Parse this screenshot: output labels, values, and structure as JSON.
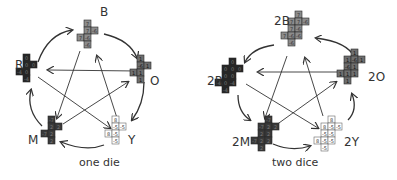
{
  "cell_size": 7,
  "colors": {
    "B": "#8c8c8c",
    "O": "#6e6e6e",
    "Y": "#ffffff",
    "M": "#3a3a3a",
    "R": "#262626",
    "text_light": "#d0d0d0",
    "text_dark": "#333333",
    "stroke": "#2a2a2a",
    "arrow": "#333333"
  },
  "panels": [
    {
      "caption": "one die",
      "caption_pos": [
        79,
        163
      ],
      "dice": [
        {
          "name": "B",
          "label": "B",
          "label_pos": [
            100,
            9
          ],
          "color": "B",
          "origin": [
            77,
            20
          ],
          "cells": [
            [
              1,
              0,
              "7"
            ],
            [
              1,
              1,
              "7"
            ],
            [
              2,
              1,
              "-6"
            ],
            [
              0,
              2,
              "7"
            ],
            [
              1,
              2,
              "-6"
            ],
            [
              1,
              3,
              "-6"
            ]
          ]
        },
        {
          "name": "O",
          "label": "O",
          "label_pos": [
            150,
            78
          ],
          "color": "O",
          "origin": [
            130,
            55
          ],
          "cells": [
            [
              1,
              0,
              "1"
            ],
            [
              1,
              1,
              "-6"
            ],
            [
              2,
              1,
              "1"
            ],
            [
              0,
              2,
              "1"
            ],
            [
              1,
              2,
              "1"
            ],
            [
              1,
              3,
              "1"
            ]
          ]
        },
        {
          "name": "Y",
          "label": "Y",
          "label_pos": [
            128,
            137
          ],
          "color": "Y",
          "origin": [
            105,
            116
          ],
          "cells": [
            [
              1,
              0,
              "8"
            ],
            [
              1,
              1,
              "-5"
            ],
            [
              2,
              1,
              "-5"
            ],
            [
              0,
              2,
              "8"
            ],
            [
              1,
              2,
              "-5"
            ],
            [
              1,
              3,
              "-5"
            ]
          ]
        },
        {
          "name": "M",
          "label": "M",
          "label_pos": [
            28,
            137
          ],
          "color": "M",
          "origin": [
            41,
            116
          ],
          "cells": [
            [
              1,
              0,
              "-7"
            ],
            [
              1,
              1,
              "2"
            ],
            [
              2,
              1,
              "2"
            ],
            [
              0,
              2,
              "-7"
            ],
            [
              1,
              2,
              "2"
            ],
            [
              1,
              3,
              "2"
            ]
          ]
        },
        {
          "name": "R",
          "label": "R",
          "label_pos": [
            15,
            62
          ],
          "color": "R",
          "origin": [
            16,
            54
          ],
          "cells": [
            [
              1,
              0,
              "0"
            ],
            [
              1,
              1,
              "0"
            ],
            [
              2,
              1,
              "0"
            ],
            [
              0,
              2,
              "-4"
            ],
            [
              1,
              2,
              "0"
            ],
            [
              1,
              3,
              "-4"
            ]
          ]
        }
      ],
      "arrows": [
        {
          "from": "R",
          "to": "B",
          "path": "M38 62 Q48 34 72 30",
          "type": "curve"
        },
        {
          "from": "B",
          "to": "O",
          "path": "M104 34 Q130 40 137 58",
          "type": "curve"
        },
        {
          "from": "O",
          "to": "Y",
          "path": "M144 82 Q144 104 132 120",
          "type": "curve"
        },
        {
          "from": "Y",
          "to": "M",
          "path": "M104 145 Q86 152 61 142",
          "type": "curve"
        },
        {
          "from": "M",
          "to": "R",
          "path": "M42 126 Q26 110 31 90",
          "type": "curve"
        },
        {
          "from": "O",
          "to": "R",
          "path": "M137 71 L48 70",
          "type": "straight"
        },
        {
          "from": "R",
          "to": "Y",
          "path": "M38 77 L110 128",
          "type": "straight"
        },
        {
          "from": "Y",
          "to": "B",
          "path": "M117 118 L97 56",
          "type": "straight"
        },
        {
          "from": "B",
          "to": "M",
          "path": "M80 51 L57 118",
          "type": "straight"
        },
        {
          "from": "M",
          "to": "O",
          "path": "M63 124 L128 82",
          "type": "straight"
        }
      ]
    },
    {
      "caption": "two dice",
      "caption_pos": [
        275,
        163
      ],
      "dice": [
        {
          "name": "2B",
          "label": "2B",
          "label_pos": [
            274,
            18
          ],
          "color": "B",
          "origin": [
            281,
            11
          ],
          "cells": [
            [
              2,
              0,
              "7"
            ],
            [
              1,
              1,
              "7"
            ],
            [
              2,
              1,
              "7"
            ],
            [
              3,
              1,
              "-6"
            ],
            [
              1,
              2,
              "7"
            ],
            [
              2,
              2,
              "-6"
            ],
            [
              0,
              3,
              "7"
            ],
            [
              1,
              3,
              "-6"
            ],
            [
              2,
              3,
              "-6"
            ],
            [
              1,
              4,
              "-6"
            ]
          ]
        },
        {
          "name": "2O",
          "label": "2O",
          "label_pos": [
            368,
            74
          ],
          "color": "O",
          "origin": [
            337,
            49
          ],
          "cells": [
            [
              2,
              0,
              "1"
            ],
            [
              1,
              1,
              "1"
            ],
            [
              2,
              1,
              "-6"
            ],
            [
              3,
              1,
              "1"
            ],
            [
              1,
              2,
              "-6"
            ],
            [
              2,
              2,
              "1"
            ],
            [
              0,
              3,
              "1"
            ],
            [
              1,
              3,
              "1"
            ],
            [
              2,
              3,
              "1"
            ],
            [
              1,
              4,
              "1"
            ]
          ]
        },
        {
          "name": "2Y",
          "label": "2Y",
          "label_pos": [
            344,
            139
          ],
          "color": "Y",
          "origin": [
            314,
            116
          ],
          "cells": [
            [
              2,
              0,
              "8"
            ],
            [
              1,
              1,
              "8"
            ],
            [
              2,
              1,
              "-5"
            ],
            [
              3,
              1,
              "-5"
            ],
            [
              1,
              2,
              "-5"
            ],
            [
              2,
              2,
              "-5"
            ],
            [
              0,
              3,
              "8"
            ],
            [
              1,
              3,
              "-5"
            ],
            [
              2,
              3,
              "-5"
            ],
            [
              1,
              4,
              "-5"
            ]
          ]
        },
        {
          "name": "2M",
          "label": "2M",
          "label_pos": [
            232,
            139
          ],
          "color": "M",
          "origin": [
            251,
            116
          ],
          "cells": [
            [
              2,
              0,
              "-7"
            ],
            [
              1,
              1,
              "-7"
            ],
            [
              2,
              1,
              "2"
            ],
            [
              3,
              1,
              "2"
            ],
            [
              1,
              2,
              "2"
            ],
            [
              2,
              2,
              "2"
            ],
            [
              0,
              3,
              "-7"
            ],
            [
              1,
              3,
              "2"
            ],
            [
              2,
              3,
              "2"
            ],
            [
              1,
              4,
              "2"
            ]
          ]
        },
        {
          "name": "2R",
          "label": "2R",
          "label_pos": [
            207,
            78
          ],
          "color": "R",
          "origin": [
            215,
            58
          ],
          "cells": [
            [
              2,
              0,
              "0"
            ],
            [
              1,
              1,
              "0"
            ],
            [
              2,
              1,
              "0"
            ],
            [
              3,
              1,
              "0"
            ],
            [
              1,
              2,
              "0"
            ],
            [
              2,
              2,
              "0"
            ],
            [
              0,
              3,
              "-4"
            ],
            [
              1,
              3,
              "0"
            ],
            [
              2,
              3,
              "-4"
            ],
            [
              1,
              4,
              "-4"
            ]
          ]
        }
      ],
      "arrows": [
        {
          "from": "2B",
          "to": "2R",
          "path": "M274 45 Q252 48 245 62",
          "type": "curve"
        },
        {
          "from": "2O",
          "to": "2B",
          "path": "M355 58 Q348 42 316 38",
          "type": "curve"
        },
        {
          "from": "2Y",
          "to": "2O",
          "path": "M348 120 Q358 110 352 94",
          "type": "curve"
        },
        {
          "from": "2M",
          "to": "2Y",
          "path": "M273 144 Q292 152 310 146",
          "type": "curve"
        },
        {
          "from": "2R",
          "to": "2M",
          "path": "M238 95 Q238 112 250 120",
          "type": "curve"
        },
        {
          "from": "2O",
          "to": "2R",
          "path": "M345 72 L258 72",
          "type": "straight"
        },
        {
          "from": "2R",
          "to": "2Y",
          "path": "M246 84 L318 128",
          "type": "straight"
        },
        {
          "from": "2Y",
          "to": "2B",
          "path": "M323 116 L305 58",
          "type": "straight"
        },
        {
          "from": "2B",
          "to": "2M",
          "path": "M287 56 L265 118",
          "type": "straight"
        },
        {
          "from": "2M",
          "to": "2O",
          "path": "M272 128 L336 82",
          "type": "straight"
        }
      ]
    }
  ]
}
